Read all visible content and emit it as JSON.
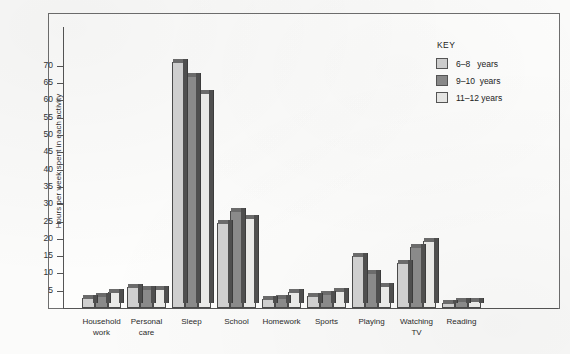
{
  "chart_data": {
    "type": "bar",
    "title": "",
    "xlabel": "",
    "ylabel": "Hours per week spent in each activity",
    "ylim": [
      0,
      72
    ],
    "ytick_step": 5,
    "yticks": [
      5,
      10,
      15,
      20,
      25,
      30,
      35,
      40,
      45,
      50,
      55,
      60,
      65,
      70
    ],
    "grid": false,
    "legend_position": "top-right",
    "categories": [
      "Household\nwork",
      "Personal\ncare",
      "Sleep",
      "School",
      "Homework",
      "Sports",
      "Playing",
      "Watching\nTV",
      "Reading"
    ],
    "series": [
      {
        "name": "6–8   years",
        "color": "#cfcfcf",
        "values": [
          3,
          6,
          71,
          24.5,
          2.5,
          3.5,
          15,
          13,
          1.5
        ]
      },
      {
        "name": "9–10  years",
        "color": "#8a8a8a",
        "values": [
          3.5,
          5.5,
          67,
          28,
          3,
          4,
          10,
          17.5,
          2
        ]
      },
      {
        "name": "11–12 years",
        "color": "#e9e9e7",
        "values": [
          4.5,
          5.5,
          62,
          26,
          4.5,
          5,
          6.5,
          19.5,
          2
        ]
      }
    ]
  },
  "legend": {
    "title": "KEY",
    "entries": [
      {
        "label": "6–8   years",
        "color": "#cfcfcf"
      },
      {
        "label": "9–10  years",
        "color": "#8a8a8a"
      },
      {
        "label": "11–12 years",
        "color": "#e9e9e7"
      }
    ]
  },
  "axis": {
    "y_title": "Hours per week spent in each activity",
    "y_tick_labels": [
      "70",
      "65",
      "60",
      "55",
      "50",
      "45",
      "40",
      "35",
      "30",
      "25",
      "20",
      "15",
      "10",
      "5"
    ]
  }
}
